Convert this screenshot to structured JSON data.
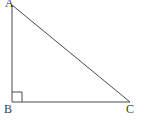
{
  "figure": {
    "name": "right-triangle-ABC",
    "background_color": "#ffffff",
    "stroke_color": "#4a4a4a",
    "label_color": "#3a3a3a",
    "stroke_width": 1,
    "vertices": [
      {
        "id": "A",
        "label": "A",
        "x": 12,
        "y": 5,
        "label_x": 5,
        "label_y": -3
      },
      {
        "id": "B",
        "label": "B",
        "x": 12,
        "y": 102,
        "label_x": 4,
        "label_y": 103
      },
      {
        "id": "C",
        "label": "C",
        "x": 130,
        "y": 102,
        "label_x": 126,
        "label_y": 103
      }
    ],
    "edges": [
      {
        "id": "AB",
        "name": "leg-vertical-AB",
        "from": "A",
        "to": "B"
      },
      {
        "id": "BC",
        "name": "leg-horizontal-BC",
        "from": "B",
        "to": "C"
      },
      {
        "id": "AC",
        "name": "hypotenuse-AC",
        "from": "A",
        "to": "C"
      }
    ],
    "right_angle": {
      "at_vertex": "B",
      "size": 10,
      "marker": "square"
    }
  }
}
